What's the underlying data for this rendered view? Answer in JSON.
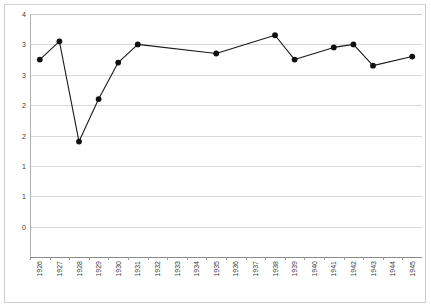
{
  "chart_data": {
    "type": "line",
    "title": "",
    "subtitle": "",
    "xlabel": "",
    "ylabel": "",
    "categories": [
      "1926",
      "1927",
      "1928",
      "1929",
      "1930",
      "1931",
      "1932",
      "1933",
      "1934",
      "1935",
      "1936",
      "1937",
      "1938",
      "1939",
      "1940",
      "1941",
      "1942",
      "1943",
      "1944",
      "1945"
    ],
    "series": [
      {
        "name": "",
        "values": [
          3.25,
          3.55,
          1.9,
          2.6,
          3.2,
          3.5,
          null,
          null,
          null,
          3.35,
          null,
          null,
          3.65,
          3.25,
          null,
          3.45,
          3.5,
          3.15,
          null,
          3.3
        ]
      }
    ],
    "plotted_points": [
      {
        "category": "1926",
        "value": 3.25
      },
      {
        "category": "1927",
        "value": 3.55
      },
      {
        "category": "1928",
        "value": 1.9
      },
      {
        "category": "1929",
        "value": 2.6
      },
      {
        "category": "1930",
        "value": 3.2
      },
      {
        "category": "1931",
        "value": 3.5
      },
      {
        "category": "1935",
        "value": 3.35
      },
      {
        "category": "1938",
        "value": 3.65
      },
      {
        "category": "1939",
        "value": 3.25
      },
      {
        "category": "1941",
        "value": 3.45
      },
      {
        "category": "1942",
        "value": 3.5
      },
      {
        "category": "1943",
        "value": 3.15
      },
      {
        "category": "1945",
        "value": 3.3
      }
    ],
    "ylim": [
      0,
      4
    ],
    "ytick_values": [
      4,
      3.5,
      3,
      2.5,
      2,
      1.5,
      1,
      0.5,
      0
    ],
    "ytick_labels": [
      "4",
      "3",
      "3",
      "2",
      "2",
      "1",
      "1",
      "0"
    ],
    "ytick_labels_full": [
      "4",
      "3",
      "3",
      "2",
      "2",
      "1",
      "1",
      "0"
    ],
    "grid": true,
    "grid_axis": "y",
    "legend": "none",
    "legend_position": "none",
    "marker": "filled-circle",
    "line_color": "#1a1a1a",
    "grid_color": "#d9d9d9",
    "axis_color": "#8a8a8a",
    "background": "#ffffff",
    "annotations": []
  },
  "colors": {
    "line": "#1a1a1a",
    "marker": "#101010",
    "grid": "#d9d9d9",
    "axis": "#8a8a8a",
    "frame": "#cfcfcf",
    "tick_text": "#3a3a3a",
    "background": "#ffffff"
  }
}
